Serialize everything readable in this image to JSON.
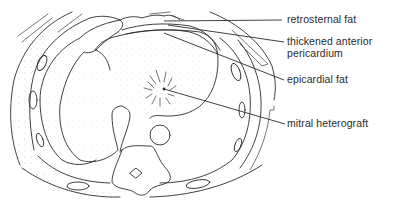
{
  "figure": {
    "labels": [
      {
        "id": "retrosternal-fat",
        "text": "retrosternal fat"
      },
      {
        "id": "thickened-anterior-pericardium",
        "line1": "thickened anterior",
        "line2": "pericardium"
      },
      {
        "id": "epicardial-fat",
        "text": "epicardial fat"
      },
      {
        "id": "mitral-heterograft",
        "text": "mitral heterograft"
      }
    ]
  }
}
